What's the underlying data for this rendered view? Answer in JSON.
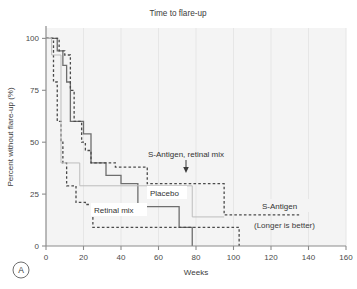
{
  "figure": {
    "panel_letter": "A",
    "title": "Time to flare-up",
    "xlabel": "Weeks",
    "ylabel": "Percent without flare-up (%)",
    "note": "(Longer is better)",
    "labels": {
      "s_antigen_retinal_mix": "S-Antigen, retinal mix",
      "placebo": "Placebo",
      "retinal_mix": "Retinal mix",
      "s_antigen": "S-Antigen"
    },
    "xticks": [
      "0",
      "20",
      "40",
      "60",
      "80",
      "100",
      "120",
      "140",
      "160"
    ],
    "yticks": [
      "0",
      "25",
      "50",
      "75",
      "100"
    ],
    "colors": {
      "plot_background": "#f4f4f4",
      "axis": "#8c8c8c",
      "grid": "#e6e6e6",
      "placebo": "#6e6e6e",
      "retinal_mix": "#4a4a4a",
      "s_antigen": "#4a4a4a",
      "s_antigen_retinal_mix": "#bdbdbd",
      "text": "#3b3b3b"
    }
  },
  "chart_data": {
    "type": "line",
    "title": "Time to flare-up",
    "subtitle": "(Longer is better)",
    "xlabel": "Weeks",
    "ylabel": "Percent without flare-up (%)",
    "xlim": [
      0,
      160
    ],
    "ylim": [
      0,
      105
    ],
    "xticks": [
      0,
      20,
      40,
      60,
      80,
      100,
      120,
      140,
      160
    ],
    "yticks": [
      0,
      25,
      50,
      75,
      100
    ],
    "grid": "vertical-faint",
    "legend": "inline-annotations",
    "series": [
      {
        "name": "Placebo",
        "style": "solid",
        "color": "#6e6e6e",
        "points": [
          [
            0,
            100
          ],
          [
            6,
            100
          ],
          [
            6,
            94
          ],
          [
            9,
            94
          ],
          [
            9,
            87
          ],
          [
            11,
            87
          ],
          [
            11,
            79
          ],
          [
            13,
            79
          ],
          [
            13,
            60
          ],
          [
            20,
            60
          ],
          [
            20,
            54
          ],
          [
            24,
            54
          ],
          [
            24,
            40
          ],
          [
            32,
            40
          ],
          [
            32,
            34
          ],
          [
            40,
            34
          ],
          [
            40,
            30
          ],
          [
            49,
            30
          ],
          [
            49,
            19
          ],
          [
            71,
            19
          ],
          [
            71,
            9
          ],
          [
            78,
            9
          ],
          [
            78,
            0
          ]
        ]
      },
      {
        "name": "Retinal mix",
        "style": "dashed",
        "color": "#4a4a4a",
        "points": [
          [
            0,
            100
          ],
          [
            4,
            100
          ],
          [
            4,
            79
          ],
          [
            6,
            79
          ],
          [
            6,
            60
          ],
          [
            8,
            60
          ],
          [
            8,
            50
          ],
          [
            9,
            50
          ],
          [
            9,
            40
          ],
          [
            11,
            40
          ],
          [
            11,
            29
          ],
          [
            16,
            29
          ],
          [
            16,
            21
          ],
          [
            21,
            21
          ],
          [
            21,
            20
          ],
          [
            25,
            20
          ],
          [
            25,
            9
          ],
          [
            103,
            9
          ],
          [
            103,
            0
          ]
        ]
      },
      {
        "name": "S-Antigen",
        "style": "dashed",
        "color": "#4a4a4a",
        "points": [
          [
            0,
            100
          ],
          [
            7,
            100
          ],
          [
            7,
            94
          ],
          [
            10,
            94
          ],
          [
            10,
            92
          ],
          [
            13,
            92
          ],
          [
            13,
            75
          ],
          [
            15,
            75
          ],
          [
            15,
            60
          ],
          [
            19,
            60
          ],
          [
            19,
            50
          ],
          [
            21,
            50
          ],
          [
            21,
            46
          ],
          [
            24,
            46
          ],
          [
            24,
            40
          ],
          [
            37,
            40
          ],
          [
            37,
            38
          ],
          [
            54,
            38
          ],
          [
            54,
            30
          ],
          [
            95,
            30
          ],
          [
            95,
            15
          ],
          [
            135,
            15
          ]
        ]
      },
      {
        "name": "S-Antigen, retinal mix",
        "style": "solid-light",
        "color": "#bdbdbd",
        "points": [
          [
            0,
            100
          ],
          [
            3,
            100
          ],
          [
            3,
            92
          ],
          [
            8,
            92
          ],
          [
            8,
            40
          ],
          [
            18,
            40
          ],
          [
            18,
            29
          ],
          [
            78,
            29
          ],
          [
            78,
            14
          ],
          [
            95,
            14
          ]
        ]
      }
    ],
    "annotations": [
      {
        "text": "S-Antigen, retinal mix",
        "x": 60,
        "y": 41,
        "arrow_to": [
          60,
          31
        ]
      },
      {
        "text": "Placebo",
        "x": 51,
        "y": 22
      },
      {
        "text": "Retinal mix",
        "x": 21,
        "y": 13
      },
      {
        "text": "S-Antigen",
        "x": 112,
        "y": 16
      },
      {
        "text": "(Longer is better)",
        "x": 110,
        "y": 6
      }
    ]
  }
}
